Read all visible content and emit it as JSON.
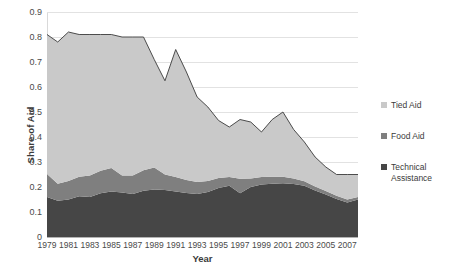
{
  "chart_data": {
    "type": "area",
    "stacked": true,
    "title": "",
    "xlabel": "Year",
    "ylabel": "Share of Aid",
    "ylim": [
      0,
      0.9
    ],
    "ytick_labels": [
      "0.9",
      "0.8",
      "0.7",
      "0.6",
      "0.5",
      "0.4",
      "0.3",
      "0.2",
      "0.1",
      "0"
    ],
    "ytick_values": [
      0.9,
      0.8,
      0.7,
      0.6,
      0.5,
      0.4,
      0.3,
      0.2,
      0.1,
      0
    ],
    "grid": true,
    "legend_position": "right",
    "x": [
      1979,
      1980,
      1981,
      1982,
      1983,
      1984,
      1985,
      1986,
      1987,
      1988,
      1989,
      1990,
      1991,
      1992,
      1993,
      1994,
      1995,
      1996,
      1997,
      1998,
      1999,
      2000,
      2001,
      2002,
      2003,
      2004,
      2005,
      2006,
      2007,
      2008
    ],
    "xtick_labels": [
      "1979",
      "1981",
      "1983",
      "1985",
      "1987",
      "1989",
      "1991",
      "1993",
      "1995",
      "1997",
      "1999",
      "2001",
      "2003",
      "2005",
      "2007"
    ],
    "xtick_values": [
      1979,
      1981,
      1983,
      1985,
      1987,
      1989,
      1991,
      1993,
      1995,
      1997,
      1999,
      2001,
      2003,
      2005,
      2007
    ],
    "series": [
      {
        "name": "Technical Assistance",
        "color": "#464646",
        "values": [
          0.16,
          0.145,
          0.15,
          0.163,
          0.16,
          0.175,
          0.182,
          0.178,
          0.172,
          0.185,
          0.19,
          0.188,
          0.182,
          0.176,
          0.172,
          0.18,
          0.196,
          0.205,
          0.175,
          0.2,
          0.21,
          0.213,
          0.215,
          0.212,
          0.205,
          0.186,
          0.17,
          0.152,
          0.138,
          0.15
        ]
      },
      {
        "name": "Food Aid",
        "color": "#7f7f7f",
        "values": [
          0.092,
          0.068,
          0.074,
          0.078,
          0.086,
          0.09,
          0.094,
          0.068,
          0.074,
          0.082,
          0.088,
          0.062,
          0.058,
          0.052,
          0.048,
          0.044,
          0.04,
          0.035,
          0.058,
          0.034,
          0.03,
          0.028,
          0.026,
          0.022,
          0.018,
          0.016,
          0.014,
          0.013,
          0.012,
          0.01
        ]
      },
      {
        "name": "Tied Aid",
        "color": "#c9c9c9",
        "values": [
          0.558,
          0.567,
          0.596,
          0.569,
          0.564,
          0.545,
          0.534,
          0.554,
          0.554,
          0.533,
          0.432,
          0.375,
          0.51,
          0.432,
          0.34,
          0.296,
          0.23,
          0.2,
          0.237,
          0.226,
          0.18,
          0.229,
          0.259,
          0.196,
          0.157,
          0.118,
          0.096,
          0.085,
          0.1,
          0.09
        ]
      }
    ],
    "totals": [
      0.81,
      0.78,
      0.82,
      0.81,
      0.81,
      0.81,
      0.81,
      0.8,
      0.8,
      0.8,
      0.71,
      0.625,
      0.75,
      0.66,
      0.56,
      0.52,
      0.466,
      0.44,
      0.47,
      0.46,
      0.42,
      0.47,
      0.5,
      0.43,
      0.38,
      0.32,
      0.28,
      0.25,
      0.25,
      0.25
    ]
  },
  "legend": {
    "items": [
      {
        "label": "Tied Aid",
        "color": "#c9c9c9"
      },
      {
        "label": "Food Aid",
        "color": "#7f7f7f"
      },
      {
        "label": "Technical Assistance",
        "color": "#464646"
      }
    ]
  }
}
